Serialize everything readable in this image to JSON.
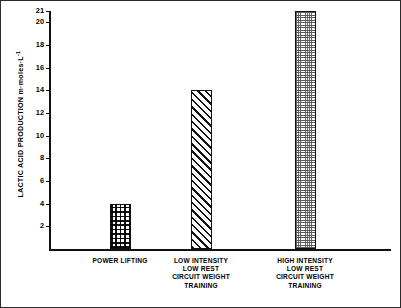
{
  "chart_data": {
    "type": "bar",
    "title": "",
    "xlabel": "",
    "ylabel": "LACTIC ACID PRODUCTION m·moles·L",
    "ylabel_exponent": "-1",
    "categories": [
      "POWER LIFTING",
      "LOW INTENSITY\nLOW REST\nCIRCUIT WEIGHT\nTRAINING",
      "HIGH INTENSITY\nLOW REST\nCIRCUIT WEIGHT\nTRAINING"
    ],
    "values": [
      4,
      14,
      21
    ],
    "ylim": [
      0,
      21
    ],
    "yticks": [
      2,
      4,
      6,
      8,
      10,
      12,
      14,
      16,
      18,
      20,
      21
    ],
    "ytick_labels": [
      "2",
      "4",
      "6",
      "8",
      "10",
      "12",
      "14",
      "16",
      "18",
      "20",
      "21"
    ],
    "grid": false,
    "legend": "none",
    "bar_fills": [
      "checker",
      "hatch",
      "stipple"
    ],
    "colors": {
      "axis": "#111111",
      "bar_outline": "#111111",
      "bar_face": "#ffffff",
      "frame": "#2b2b2b",
      "background": "#ffffff"
    }
  }
}
